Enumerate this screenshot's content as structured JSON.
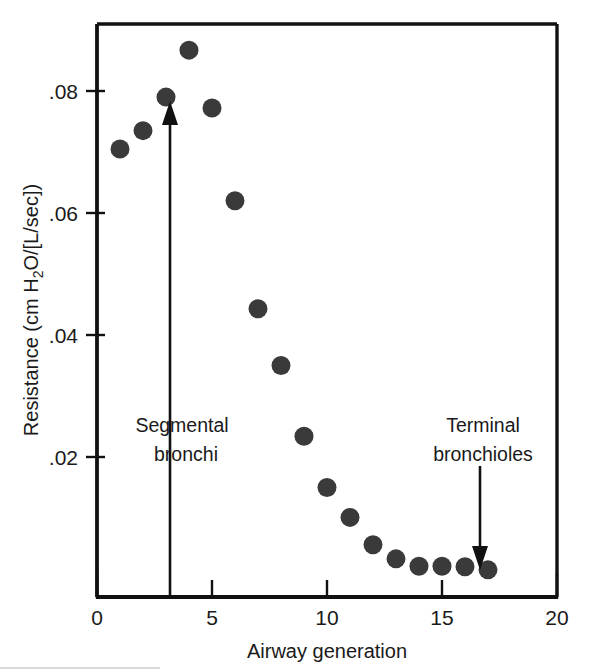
{
  "chart_data": {
    "type": "scatter",
    "title": "",
    "xlabel": "Airway generation",
    "ylabel": "Resistance (cm H₂O/[L/sec])",
    "ylabel_parts": {
      "pre": "Resistance (cm H",
      "sub": "2",
      "post": "O/[L/sec])"
    },
    "xlim": [
      0,
      20
    ],
    "ylim": [
      0,
      0.0935
    ],
    "grid": false,
    "legend": null,
    "xticks": [
      0,
      5,
      10,
      15,
      20
    ],
    "xtick_labels": [
      "0",
      "5",
      "10",
      "15",
      "20"
    ],
    "yticks": [
      0.02,
      0.04,
      0.06,
      0.08
    ],
    "ytick_labels": [
      ".02",
      ".04",
      ".06",
      ".08"
    ],
    "x": [
      1,
      2,
      3,
      4,
      5,
      6,
      7,
      8,
      9,
      10,
      11,
      12,
      13,
      14,
      15,
      16,
      17
    ],
    "values": [
      0.0705,
      0.0735,
      0.079,
      0.0867,
      0.0772,
      0.062,
      0.0443,
      0.035,
      0.0234,
      0.015,
      0.0101,
      0.0056,
      0.0033,
      0.0021,
      0.0021,
      0.002,
      0.0015
    ],
    "series": [
      {
        "name": "Airway resistance",
        "values": [
          0.0705,
          0.0735,
          0.079,
          0.0867,
          0.0772,
          0.062,
          0.0443,
          0.035,
          0.0234,
          0.015,
          0.0101,
          0.0056,
          0.0033,
          0.0021,
          0.0021,
          0.002,
          0.0015
        ]
      }
    ],
    "marker": "filled-circle",
    "marker_color": "#3a3a3a",
    "annotations": [
      {
        "name": "segmental-bronchi",
        "label_line1": "Segmental",
        "label_line2": "bronchi",
        "arrow_direction": "up",
        "x": 3.2,
        "label_x": 3.2,
        "arrow_from_y": 0.0,
        "arrow_to_y": 0.0765
      },
      {
        "name": "terminal-bronchioles",
        "label_line1": "Terminal",
        "label_line2": "bronchioles",
        "arrow_direction": "down",
        "x": 16.65,
        "label_x": 16.65,
        "arrow_from_y": 0.0208,
        "arrow_to_y": 0.0055
      }
    ]
  },
  "colors": {
    "axis": "#111111",
    "marker": "#3a3a3a",
    "text": "#1a1a1a",
    "background": "#ffffff"
  }
}
